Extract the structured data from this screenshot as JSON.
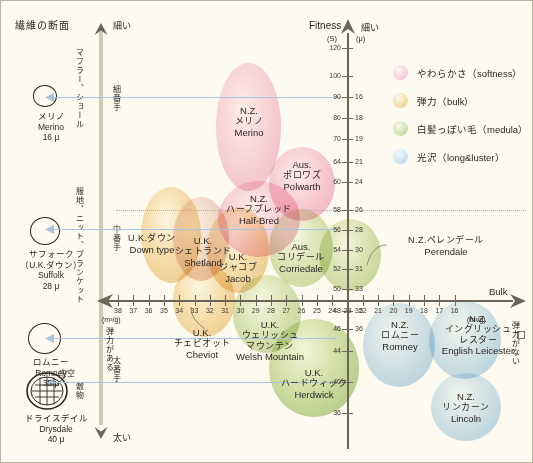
{
  "title": "繊維の断面",
  "axes": {
    "y_top_label": "細い",
    "y_bottom_label": "太い",
    "y_name": "Fitness",
    "y_unit_s": "(S)",
    "y_unit_mu": "(μ)",
    "x_right_label": "Bulk",
    "x_unit": "(m³/g)",
    "x_left_note": "弾力がある",
    "x_right_note": "弾力がない",
    "y_ticks_s": [
      "120",
      "100",
      "90",
      "80",
      "70",
      "64",
      "60",
      "58",
      "56",
      "54",
      "52",
      "50",
      "48",
      "46",
      "44",
      "40",
      "36"
    ],
    "y_ticks_mu": [
      "",
      "",
      "16",
      "18",
      "19",
      "21",
      "24",
      "26",
      "28",
      "30",
      "31",
      "33",
      "35",
      "36",
      "",
      "",
      ""
    ],
    "x_ticks_upper": [
      "38",
      "37",
      "36",
      "35",
      "34",
      "33",
      "32",
      "31",
      "30",
      "29",
      "28",
      "27",
      "26",
      "25",
      "24",
      "23"
    ],
    "x_ticks_lower": [
      "22",
      "21",
      "20",
      "19",
      "18",
      "17",
      "16"
    ]
  },
  "use_categories": [
    {
      "label": "マフラー、ショール"
    },
    {
      "label": "服地、ニット、ブランケット"
    },
    {
      "label": "敷物"
    }
  ],
  "yarn_counts": [
    {
      "label": "細番手"
    },
    {
      "label": "中番手"
    },
    {
      "label": "太番手"
    }
  ],
  "legend": [
    {
      "name": "やわらかさ（softness）",
      "color": "#f6cede",
      "key": "softness"
    },
    {
      "name": "弾力（bulk）",
      "color": "#f0d39a",
      "key": "bulk"
    },
    {
      "name": "白髪っぽい毛（medula）",
      "color": "#cfd9a6",
      "key": "medula"
    },
    {
      "name": "光沢（long&luster）",
      "color": "#c6dcee",
      "key": "luster"
    }
  ],
  "cross_sections": [
    {
      "ja": "メリノ",
      "en": "Merino",
      "micron": "16 μ",
      "hollow": ""
    },
    {
      "ja": "サフォーク",
      "ja2": "（U.K.ダウン）",
      "en": "Suffolk",
      "micron": "28 μ",
      "hollow": ""
    },
    {
      "ja": "ロムニー",
      "en": "Romney",
      "micron": "35 μ",
      "hollow": ""
    },
    {
      "ja": "ドライスデイル",
      "en": "Drysdale",
      "micron": "40 μ",
      "hollow": "中空"
    }
  ],
  "chart_data": {
    "type": "scatter",
    "xlabel": "Bulk (m³/g)",
    "ylabel": "Fitness (S) / (μ)",
    "xlim": [
      38,
      16
    ],
    "ylim": [
      36,
      120
    ],
    "grid": false,
    "legend_position": "top-right",
    "bubbles": [
      {
        "name": "N.Z. メリノ",
        "name_en": "Merino",
        "region": "N.Z.",
        "group": "softness",
        "x": 31.5,
        "y": 92,
        "size_x": 65,
        "size_y": 125
      },
      {
        "name": "Aus. ポロワズ",
        "name_en": "Polwarth",
        "region": "Aus.",
        "group": "softness",
        "x": 28.5,
        "y": 61,
        "size_x": 62,
        "size_y": 70
      },
      {
        "name": "N.Z. ハーフブレッド",
        "name_en": "Half-Bred",
        "region": "N.Z.",
        "group": "softness",
        "x": 30.5,
        "y": 57,
        "size_x": 78,
        "size_y": 72
      },
      {
        "name": "U.K. ダウン",
        "name_en": "Down type",
        "region": "U.K.",
        "group": "bulk",
        "x": 34.2,
        "y": 53,
        "size_x": 58,
        "size_y": 90
      },
      {
        "name": "U.K. シェトランド",
        "name_en": "Shetland",
        "region": "U.K.",
        "group": "bulk",
        "x": 32.8,
        "y": 53,
        "size_x": 52,
        "size_y": 78
      },
      {
        "name": "U.K. ジャコブ",
        "name_en": "Jacob",
        "region": "U.K.",
        "group": "bulk",
        "x": 31,
        "y": 51,
        "size_x": 58,
        "size_y": 80
      },
      {
        "name": "Aus. コリデール",
        "name_en": "Corriedale",
        "region": "Aus.",
        "group": "medula",
        "x": 27.5,
        "y": 52,
        "size_x": 60,
        "size_y": 72
      },
      {
        "name": "N.Z. ペレンデール",
        "name_en": "Perendale",
        "region": "N.Z.",
        "group": "medula",
        "x": 24.5,
        "y": 51,
        "size_x": 58,
        "size_y": 66
      },
      {
        "name": "U.K. チェビオット",
        "name_en": "Cheviot",
        "region": "U.K.",
        "group": "bulk",
        "x": 33,
        "y": 47,
        "size_x": 58,
        "size_y": 70
      },
      {
        "name": "U.K. ウェリッシュマウンテン",
        "name_en": "Welsh Mountain",
        "region": "U.K.",
        "group": "medula",
        "x": 29,
        "y": 47,
        "size_x": 62,
        "size_y": 72
      },
      {
        "name": "U.K. ハードウィック",
        "name_en": "Herdwick",
        "region": "U.K.",
        "group": "medula",
        "x": 27,
        "y": 43,
        "size_x": 82,
        "size_y": 90
      },
      {
        "name": "N.Z. ロムニー",
        "name_en": "Romney",
        "region": "N.Z.",
        "group": "luster",
        "x": 22.5,
        "y": 47,
        "size_x": 68,
        "size_y": 78
      },
      {
        "name": "N.Z. イングリッシュレスター",
        "name_en": "English Leicester",
        "region": "N.Z.",
        "group": "luster",
        "x": 19.5,
        "y": 47,
        "size_x": 66,
        "size_y": 72
      },
      {
        "name": "N.Z. リンカーン",
        "name_en": "Lincoln",
        "region": "N.Z.",
        "group": "luster",
        "x": 19.5,
        "y": 40,
        "size_x": 66,
        "size_y": 62
      }
    ]
  },
  "bubble_labels": [
    {
      "l1": "N.Z.",
      "l2": "メリノ",
      "l3": "Merino"
    },
    {
      "l1": "Aus.",
      "l2": "ポロワズ",
      "l3": "Polwarth"
    },
    {
      "l1": "N.Z.",
      "l2": "ハーフブレッド",
      "l3": "Half-Bred"
    },
    {
      "l1": "U.K.ダウン",
      "l2": "Down type",
      "l3": ""
    },
    {
      "l1": "U.K.",
      "l2": "シェトランド",
      "l3": "Shetland"
    },
    {
      "l1": "U.K.",
      "l2": "ジャコブ",
      "l3": "Jacob"
    },
    {
      "l1": "Aus.",
      "l2": "コリデール",
      "l3": "Corriedale"
    },
    {
      "l1": "N.Z.ペレンデール",
      "l2": "Perendale",
      "l3": ""
    },
    {
      "l1": "U.K.",
      "l2": "チェビオット",
      "l3": "Cheviot"
    },
    {
      "l1": "U.K.",
      "l2": "ウェリッシュ",
      "l3": "マウンテン",
      "l4": "Welsh Mountain"
    },
    {
      "l1": "U.K.",
      "l2": "ハードウィック",
      "l3": "Herdwick"
    },
    {
      "l1": "N.Z.",
      "l2": "ロムニー",
      "l3": "Romney"
    },
    {
      "l1": "N.Z.",
      "l2": "イングリッシュ",
      "l3": "レスター",
      "l4": "English Leicester"
    },
    {
      "l1": "N.Z.",
      "l2": "リンカーン",
      "l3": "Lincoln"
    }
  ]
}
